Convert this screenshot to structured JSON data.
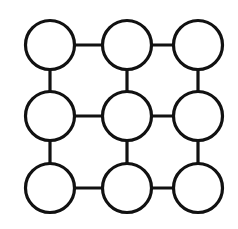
{
  "diagram": {
    "type": "grid-graph",
    "rows": 3,
    "cols": 3,
    "stroke_color": "#111111",
    "fill_color": "#ffffff",
    "background": "#ffffff",
    "stroke_width": 3.2,
    "node_radius": 24.5,
    "col_x": [
      50,
      127,
      198
    ],
    "row_y": [
      45,
      116,
      188
    ],
    "nodes": [
      {
        "id": "n00",
        "row": 0,
        "col": 0
      },
      {
        "id": "n01",
        "row": 0,
        "col": 1
      },
      {
        "id": "n02",
        "row": 0,
        "col": 2
      },
      {
        "id": "n10",
        "row": 1,
        "col": 0
      },
      {
        "id": "n11",
        "row": 1,
        "col": 1
      },
      {
        "id": "n12",
        "row": 1,
        "col": 2
      },
      {
        "id": "n20",
        "row": 2,
        "col": 0
      },
      {
        "id": "n21",
        "row": 2,
        "col": 1
      },
      {
        "id": "n22",
        "row": 2,
        "col": 2
      }
    ],
    "edges": [
      [
        "n00",
        "n01"
      ],
      [
        "n01",
        "n02"
      ],
      [
        "n10",
        "n11"
      ],
      [
        "n11",
        "n12"
      ],
      [
        "n20",
        "n21"
      ],
      [
        "n21",
        "n22"
      ],
      [
        "n00",
        "n10"
      ],
      [
        "n10",
        "n20"
      ],
      [
        "n01",
        "n11"
      ],
      [
        "n11",
        "n21"
      ],
      [
        "n02",
        "n12"
      ],
      [
        "n12",
        "n22"
      ]
    ]
  }
}
